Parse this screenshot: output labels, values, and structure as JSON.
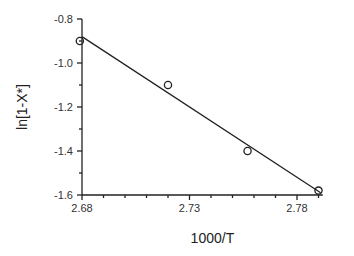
{
  "chart_data": {
    "type": "scatter",
    "title": "",
    "xlabel": "1000/T",
    "ylabel": "ln[1-X*]",
    "xlim": [
      2.68,
      2.792
    ],
    "ylim": [
      -1.6,
      -0.8
    ],
    "grid": false,
    "legend": null,
    "x_ticks": [
      2.68,
      2.73,
      2.78
    ],
    "x_tick_labels": [
      "2.68",
      "2.73",
      "2.78"
    ],
    "x_minor_ticks": [
      2.69,
      2.7,
      2.71,
      2.72,
      2.74,
      2.75,
      2.76,
      2.77,
      2.79
    ],
    "y_ticks": [
      -0.8,
      -1.0,
      -1.2,
      -1.4,
      -1.6
    ],
    "y_tick_labels": [
      "-0.8",
      "-1.0",
      "-1.2",
      "-1.4",
      "-1.6"
    ],
    "y_minor_ticks": [
      -0.9,
      -1.1,
      -1.3,
      -1.5
    ],
    "series": [
      {
        "name": "data",
        "marker": "open-circle",
        "x": [
          2.679,
          2.72,
          2.757,
          2.79
        ],
        "y": [
          -0.9,
          -1.1,
          -1.4,
          -1.58
        ]
      },
      {
        "name": "linear fit",
        "style": "line",
        "x": [
          2.68,
          2.791
        ],
        "y": [
          -0.88,
          -1.59
        ]
      }
    ]
  }
}
